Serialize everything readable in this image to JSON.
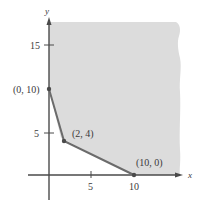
{
  "figure": {
    "type": "feasible-region-graph",
    "axes": {
      "x_label": "x",
      "y_label": "y",
      "x_ticks": [
        "5",
        "10"
      ],
      "y_ticks": [
        "5",
        "15"
      ]
    },
    "vertices": [
      {
        "label": "(0, 10)",
        "x": 0,
        "y": 10
      },
      {
        "label": "(2, 4)",
        "x": 2,
        "y": 4
      },
      {
        "label": "(10, 0)",
        "x": 10,
        "y": 0
      }
    ],
    "region": {
      "description": "unbounded shaded region above and right of boundary",
      "fill_color": "#dcdcdc",
      "boundary_color": "#6b6b6b"
    }
  }
}
